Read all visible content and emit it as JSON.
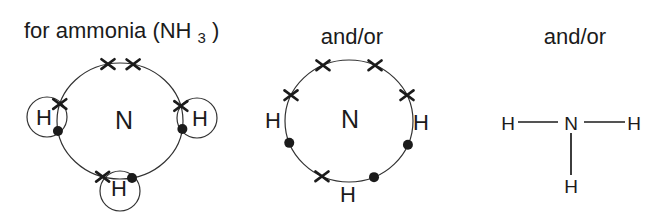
{
  "canvas": {
    "width": 661,
    "height": 219,
    "background": "#ffffff",
    "ink": "#1b1b1b",
    "line_color": "#323232"
  },
  "figure": {
    "panels": [
      {
        "name": "overlapping-dot-cross-diagram",
        "title": {
          "text": "for ammonia (NH",
          "sub": "3",
          "suffix": ")"
        },
        "shell": {
          "cx": 120,
          "cy": 121,
          "rx": 63,
          "ry": 58,
          "label": "N",
          "label_x": 124,
          "label_y": 120
        },
        "hydrogen_circles": [
          {
            "label": "H",
            "cx": 47,
            "cy": 117,
            "r": 20,
            "label_x": 44,
            "label_y": 117
          },
          {
            "label": "H",
            "cx": 197,
            "cy": 118,
            "r": 20,
            "label_x": 200,
            "label_y": 118
          },
          {
            "label": "H",
            "cx": 120,
            "cy": 191,
            "r": 20,
            "label_x": 119,
            "label_y": 188
          }
        ],
        "electrons": [
          {
            "type": "cross",
            "angle": 101
          },
          {
            "type": "cross",
            "angle": 78
          },
          {
            "type": "cross",
            "angle": 163
          },
          {
            "type": "dot",
            "angle": 190
          },
          {
            "type": "cross",
            "angle": 15
          },
          {
            "type": "dot",
            "angle": 352
          },
          {
            "type": "cross",
            "angle": 254
          },
          {
            "type": "dot",
            "angle": 281
          }
        ]
      },
      {
        "name": "separate-dot-cross-diagram",
        "title": {
          "text": "and/or"
        },
        "shell": {
          "cx": 349,
          "cy": 121,
          "rx": 64,
          "ry": 61,
          "label": "N",
          "label_x": 350,
          "label_y": 119
        },
        "hydrogen_labels": [
          {
            "label": "H",
            "x": 273,
            "y": 120
          },
          {
            "label": "H",
            "x": 421,
            "y": 122
          },
          {
            "label": "H",
            "x": 348,
            "y": 194
          }
        ],
        "electrons": [
          {
            "type": "cross",
            "angle": 114
          },
          {
            "type": "cross",
            "angle": 66
          },
          {
            "type": "cross",
            "angle": 155
          },
          {
            "type": "cross",
            "angle": 25
          },
          {
            "type": "cross",
            "angle": 245
          },
          {
            "type": "dot",
            "angle": 201
          },
          {
            "type": "dot",
            "angle": 337
          },
          {
            "type": "dot",
            "angle": 293
          }
        ]
      },
      {
        "name": "structural-formula",
        "title": {
          "text": "and/or"
        },
        "atoms": [
          {
            "label": "H",
            "x": 508,
            "y": 123
          },
          {
            "label": "N",
            "x": 571,
            "y": 123
          },
          {
            "label": "H",
            "x": 634,
            "y": 123
          },
          {
            "label": "H",
            "x": 571,
            "y": 186
          }
        ],
        "bonds": [
          {
            "x1": 518,
            "y1": 122,
            "x2": 558,
            "y2": 122
          },
          {
            "x1": 584,
            "y1": 122,
            "x2": 625,
            "y2": 122
          },
          {
            "x1": 571,
            "y1": 133,
            "x2": 571,
            "y2": 175
          }
        ]
      }
    ]
  }
}
